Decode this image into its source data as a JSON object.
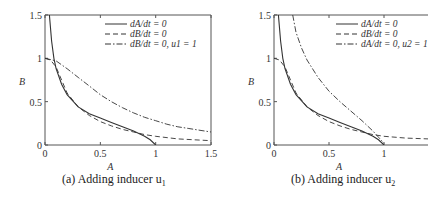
{
  "chart_data": [
    {
      "type": "line",
      "caption": "(a) Adding inducer u1",
      "caption_prefix": "(a) Adding inducer u",
      "caption_sub": "1",
      "xlabel": "A",
      "ylabel": "B",
      "xlim": [
        0,
        1.5
      ],
      "ylim": [
        0,
        1.5
      ],
      "xticks": [
        "0",
        "0.5",
        "1",
        "1.5"
      ],
      "yticks": [
        "0",
        "0.5",
        "1",
        "1.5"
      ],
      "grid": false,
      "legend_position": "upper right",
      "legend": [
        "dA/dt = 0",
        "dB/dt = 0",
        "dB/dt = 0, u1 = 1"
      ],
      "series": [
        {
          "name": "dA/dt = 0",
          "style": "solid",
          "x": [
            0.04,
            0.06,
            0.08,
            0.1,
            0.15,
            0.2,
            0.3,
            0.4,
            0.5,
            0.6,
            0.7,
            0.8,
            0.9,
            0.95,
            1.0
          ],
          "y": [
            1.5,
            1.2,
            1.0,
            0.88,
            0.7,
            0.58,
            0.44,
            0.36,
            0.31,
            0.26,
            0.21,
            0.16,
            0.1,
            0.06,
            0.0
          ]
        },
        {
          "name": "dB/dt = 0",
          "style": "dashed",
          "x": [
            0.0,
            0.05,
            0.1,
            0.15,
            0.2,
            0.3,
            0.4,
            0.5,
            0.6,
            0.7,
            0.8,
            0.9,
            1.0,
            1.2,
            1.5
          ],
          "y": [
            1.0,
            0.98,
            0.9,
            0.75,
            0.6,
            0.44,
            0.34,
            0.27,
            0.22,
            0.18,
            0.15,
            0.12,
            0.1,
            0.07,
            0.05
          ]
        },
        {
          "name": "dB/dt = 0, u1 = 1",
          "style": "dashdot",
          "x": [
            0.0,
            0.1,
            0.2,
            0.3,
            0.4,
            0.5,
            0.6,
            0.7,
            0.8,
            0.9,
            1.0,
            1.1,
            1.2,
            1.3,
            1.4,
            1.5
          ],
          "y": [
            1.0,
            0.97,
            0.88,
            0.78,
            0.68,
            0.58,
            0.5,
            0.43,
            0.37,
            0.32,
            0.28,
            0.24,
            0.21,
            0.19,
            0.17,
            0.15
          ]
        }
      ]
    },
    {
      "type": "line",
      "caption": "(b) Adding inducer u2",
      "caption_prefix": "(b) Adding inducer u",
      "caption_sub": "2",
      "xlabel": "A",
      "ylabel": "B",
      "xlim": [
        0,
        1.4
      ],
      "ylim": [
        0,
        1.5
      ],
      "xticks": [
        "0",
        "0.5",
        "1"
      ],
      "yticks": [
        "0",
        "0.5",
        "1",
        "1.5"
      ],
      "grid": false,
      "legend_position": "upper right",
      "legend": [
        "dA/dt = 0",
        "dB/dt = 0",
        "dA/dt = 0, u2 = 1"
      ],
      "series": [
        {
          "name": "dA/dt = 0",
          "style": "solid",
          "x": [
            0.04,
            0.06,
            0.08,
            0.1,
            0.15,
            0.2,
            0.3,
            0.4,
            0.5,
            0.6,
            0.7,
            0.8,
            0.9,
            0.95,
            1.0
          ],
          "y": [
            1.5,
            1.2,
            1.0,
            0.88,
            0.7,
            0.58,
            0.44,
            0.36,
            0.31,
            0.26,
            0.21,
            0.16,
            0.1,
            0.06,
            0.0
          ]
        },
        {
          "name": "dB/dt = 0",
          "style": "dashed",
          "x": [
            0.0,
            0.05,
            0.1,
            0.15,
            0.2,
            0.3,
            0.4,
            0.5,
            0.6,
            0.7,
            0.8,
            0.9,
            1.0,
            1.1,
            1.2,
            1.4
          ],
          "y": [
            1.0,
            0.98,
            0.9,
            0.75,
            0.6,
            0.44,
            0.34,
            0.27,
            0.22,
            0.18,
            0.15,
            0.12,
            0.1,
            0.09,
            0.08,
            0.07
          ]
        },
        {
          "name": "dA/dt = 0, u2 = 1",
          "style": "dashdot",
          "x": [
            0.17,
            0.2,
            0.25,
            0.3,
            0.4,
            0.5,
            0.6,
            0.7,
            0.8,
            0.9,
            0.95,
            1.0
          ],
          "y": [
            1.5,
            1.3,
            1.12,
            0.98,
            0.78,
            0.62,
            0.5,
            0.39,
            0.28,
            0.16,
            0.09,
            0.02
          ]
        }
      ]
    }
  ]
}
